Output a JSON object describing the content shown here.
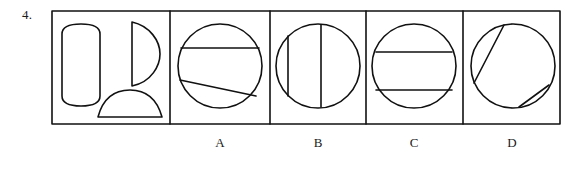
{
  "question": {
    "number": "4.",
    "type": "shape-assembly-multiple-choice"
  },
  "prompt_panel": {
    "name": "component-pieces-panel",
    "pieces": [
      {
        "name": "rounded-rectangle-piece",
        "description": "tall rounded rectangle with curved top and bottom edges"
      },
      {
        "name": "half-disc-piece",
        "description": "half disc with flat vertical left edge bulging right"
      },
      {
        "name": "dome-segment-piece",
        "description": "shallow circular segment / dome with flat bottom edge"
      }
    ]
  },
  "options": [
    {
      "label": "A",
      "name": "option-a",
      "figure": "circle with one horizontal chord above center and one slanted chord below center"
    },
    {
      "label": "B",
      "name": "option-b",
      "figure": "circle with two vertical chords, one short near left edge and one long near center"
    },
    {
      "label": "C",
      "name": "option-c",
      "figure": "circle with two horizontal parallel chords above and below center"
    },
    {
      "label": "D",
      "name": "option-d",
      "figure": "circle with two parallel slanted chords, one long upper-left and one short lower-right"
    }
  ],
  "colors": {
    "ink": "#1a1a1a",
    "stroke": "#111111",
    "background": "#ffffff"
  },
  "geometry": {
    "frame": {
      "x": 52,
      "y": 11,
      "width": 508,
      "height": 113
    },
    "dividers_x": [
      170,
      270,
      366,
      463
    ],
    "circles": [
      {
        "cx": 220,
        "cy": 66,
        "r": 42
      },
      {
        "cx": 318,
        "cy": 66,
        "r": 42
      },
      {
        "cx": 414,
        "cy": 66,
        "r": 42
      },
      {
        "cx": 513,
        "cy": 66,
        "r": 42
      }
    ]
  }
}
